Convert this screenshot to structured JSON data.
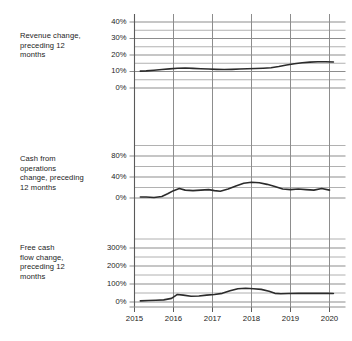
{
  "figure": {
    "background": "#ffffff",
    "line_color": "#2b2b2b",
    "grid_color": "#8d8d8d",
    "axis_color": "#5a5a5a",
    "text_color": "#1c1c1c"
  },
  "x_axis": {
    "tick_labels": [
      "2015",
      "2016",
      "2017",
      "2018",
      "2019",
      "2020"
    ],
    "range": [
      2015,
      2020
    ]
  },
  "panels": [
    {
      "label": "Revenue change,\npreceding 12\nmonths",
      "y_ticks": [
        "0%",
        "10%",
        "20%",
        "30%",
        "40%"
      ]
    },
    {
      "label": "Cash from\noperations\nchange, preceding\n12 months",
      "y_ticks": [
        "0%",
        "40%",
        "80%"
      ]
    },
    {
      "label": "Free cash\nflow change,\npreceding 12\nmonths",
      "y_ticks": [
        "0%",
        "100%",
        "200%",
        "300%"
      ]
    }
  ],
  "chart_data": [
    {
      "type": "line",
      "title": "Revenue change, preceding 12 months",
      "xlabel": "",
      "ylabel": "Revenue change, preceding 12 months",
      "xlim": [
        2015,
        2020
      ],
      "ylim": [
        0,
        40
      ],
      "yticks": [
        0,
        10,
        20,
        30,
        40
      ],
      "ytick_labels": [
        "0%",
        "10%",
        "20%",
        "30%",
        "40%"
      ],
      "minor_yticks": [
        5,
        15,
        25,
        35
      ],
      "xticks": [
        2015,
        2016,
        2017,
        2018,
        2019,
        2020
      ],
      "xtick_labels": [
        "2015",
        "2016",
        "2017",
        "2018",
        "2019",
        "2020"
      ],
      "grid": true,
      "legend": "none",
      "series": [
        {
          "name": "Revenue change",
          "x": [
            2015.15,
            2015.3,
            2015.5,
            2015.7,
            2015.9,
            2016.1,
            2016.3,
            2016.5,
            2016.7,
            2016.9,
            2017.1,
            2017.3,
            2017.5,
            2017.7,
            2017.9,
            2018.1,
            2018.3,
            2018.5,
            2018.7,
            2018.9,
            2019.1,
            2019.3,
            2019.5,
            2019.7,
            2019.9,
            2020.1
          ],
          "values": [
            10.2,
            10.4,
            10.8,
            11.2,
            11.6,
            12.0,
            12.1,
            11.9,
            11.7,
            11.5,
            11.3,
            11.2,
            11.3,
            11.5,
            11.7,
            11.8,
            12.0,
            12.3,
            13.0,
            13.9,
            14.7,
            15.3,
            15.7,
            15.9,
            15.9,
            15.8
          ]
        }
      ]
    },
    {
      "type": "line",
      "title": "Cash from operations change, preceding 12 months",
      "xlabel": "",
      "ylabel": "Cash from operations change, preceding 12 months",
      "xlim": [
        2015,
        2020
      ],
      "ylim": [
        0,
        100
      ],
      "yticks": [
        0,
        40,
        80
      ],
      "ytick_labels": [
        "0%",
        "40%",
        "80%"
      ],
      "minor_yticks": [
        20,
        60,
        100
      ],
      "xticks": [
        2015,
        2016,
        2017,
        2018,
        2019,
        2020
      ],
      "xtick_labels": [
        "2015",
        "2016",
        "2017",
        "2018",
        "2019",
        "2020"
      ],
      "grid": true,
      "legend": "none",
      "series": [
        {
          "name": "Cash from operations change",
          "x": [
            2015.15,
            2015.3,
            2015.5,
            2015.7,
            2015.85,
            2016.0,
            2016.15,
            2016.3,
            2016.5,
            2016.7,
            2016.9,
            2017.05,
            2017.2,
            2017.4,
            2017.6,
            2017.8,
            2018.0,
            2018.2,
            2018.4,
            2018.6,
            2018.8,
            2019.0,
            2019.2,
            2019.4,
            2019.6,
            2019.8,
            2020.0
          ],
          "values": [
            2,
            2,
            1,
            3,
            8,
            14,
            18,
            15,
            14,
            15,
            16,
            14,
            13,
            17,
            23,
            28,
            30,
            29,
            26,
            22,
            17,
            16,
            17,
            16,
            15,
            18,
            15
          ]
        }
      ]
    },
    {
      "type": "line",
      "title": "Free cash flow change, preceding 12 months",
      "xlabel": "",
      "ylabel": "Free cash flow change, preceding 12 months",
      "xlim": [
        2015,
        2020
      ],
      "ylim": [
        0,
        350
      ],
      "yticks": [
        0,
        100,
        200,
        300
      ],
      "ytick_labels": [
        "0%",
        "100%",
        "200%",
        "300%"
      ],
      "minor_yticks": [
        50,
        150,
        250,
        350
      ],
      "xticks": [
        2015,
        2016,
        2017,
        2018,
        2019,
        2020
      ],
      "xtick_labels": [
        "2015",
        "2016",
        "2017",
        "2018",
        "2019",
        "2020"
      ],
      "grid": true,
      "legend": "none",
      "series": [
        {
          "name": "Free cash flow change",
          "x": [
            2015.15,
            2015.35,
            2015.55,
            2015.75,
            2015.95,
            2016.1,
            2016.25,
            2016.45,
            2016.65,
            2016.85,
            2017.05,
            2017.25,
            2017.45,
            2017.65,
            2017.85,
            2018.05,
            2018.25,
            2018.45,
            2018.6,
            2018.75,
            2018.95,
            2019.2,
            2019.45,
            2019.7,
            2019.95,
            2020.1
          ],
          "values": [
            6,
            8,
            10,
            12,
            20,
            42,
            38,
            32,
            33,
            38,
            42,
            48,
            62,
            74,
            76,
            74,
            70,
            60,
            48,
            46,
            47,
            48,
            48,
            48,
            48,
            47
          ]
        }
      ]
    }
  ]
}
